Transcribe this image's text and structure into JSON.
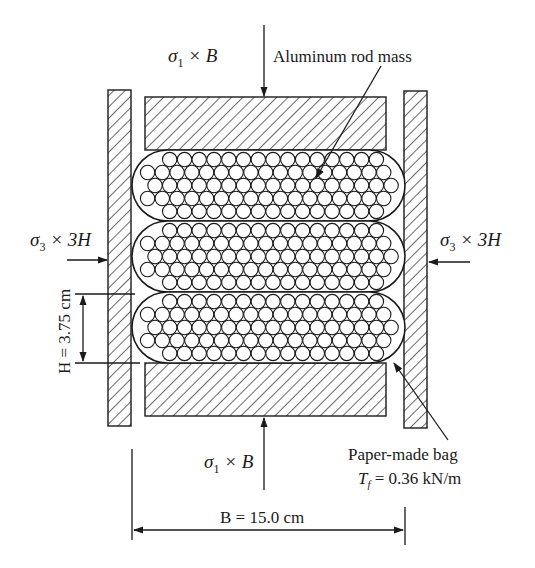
{
  "labels": {
    "top_load": "σ",
    "top_load_sub": "1",
    "top_load_rest": " × B",
    "bottom_load": "σ",
    "bottom_load_sub": "1",
    "bottom_load_rest": " × B",
    "left_load": "σ",
    "left_load_sub": "3",
    "left_load_rest": " × 3H",
    "right_load": "σ",
    "right_load_sub": "3",
    "right_load_rest": " × 3H",
    "aluminum": "Aluminum rod mass",
    "paper_bag": "Paper-made bag",
    "tension_sym": "T",
    "tension_sub": "f",
    "tension_val": " = 0.36 kN/m",
    "height_dim": "H = 3.75 cm",
    "width_dim": "B = 15.0 cm"
  },
  "components": {
    "left_wall": {
      "x": 108,
      "y": 90,
      "w": 23,
      "h": 336
    },
    "right_wall": {
      "x": 404,
      "y": 91,
      "w": 23,
      "h": 337
    },
    "top_platen": {
      "x": 145,
      "y": 97,
      "w": 241,
      "h": 53
    },
    "bottom_platen": {
      "x": 145,
      "y": 363,
      "w": 241,
      "h": 53
    },
    "bags": [
      {
        "x": 132,
        "y": 150,
        "w": 273,
        "h": 71
      },
      {
        "x": 132,
        "y": 221,
        "w": 273,
        "h": 71
      },
      {
        "x": 132,
        "y": 292,
        "w": 273,
        "h": 71
      }
    ],
    "rod_radius": 7.2,
    "colors": {
      "line": "#1a1a1a",
      "background": "#ffffff"
    }
  }
}
